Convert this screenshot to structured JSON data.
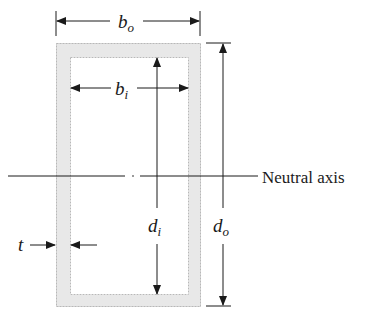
{
  "diagram": {
    "colors": {
      "wall_fill": "#e8e8e8",
      "wall_edge": "#b8b8b8",
      "line": "#1a1a1a"
    },
    "labels": {
      "outer_width": {
        "main": "b",
        "sub": "o"
      },
      "inner_width": {
        "main": "b",
        "sub": "i"
      },
      "inner_depth": {
        "main": "d",
        "sub": "i"
      },
      "outer_depth": {
        "main": "d",
        "sub": "o"
      },
      "thickness": "t",
      "neutral_axis": "Neutral axis"
    }
  }
}
